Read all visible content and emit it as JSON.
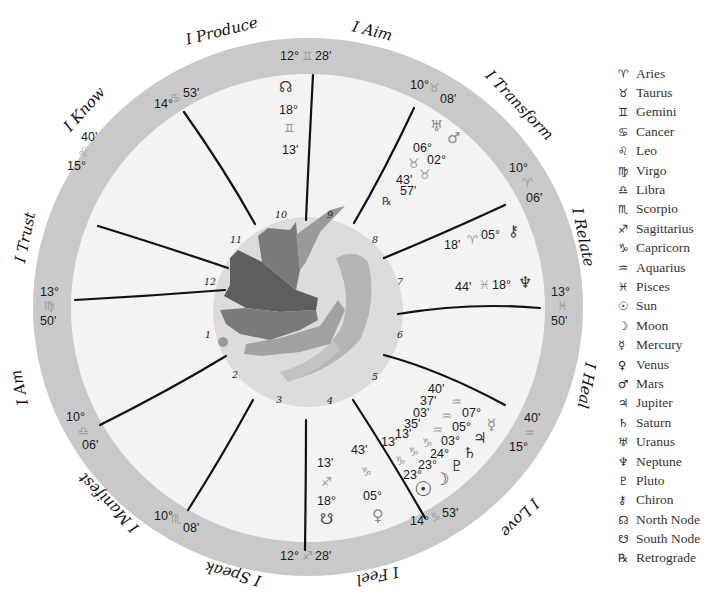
{
  "chart": {
    "themes": [
      {
        "label": "I Produce"
      },
      {
        "label": "I Aim"
      },
      {
        "label": "I Transform"
      },
      {
        "label": "I Relate"
      },
      {
        "label": "I Heal"
      },
      {
        "label": "I Love"
      },
      {
        "label": "I Feel"
      },
      {
        "label": "I Speak"
      },
      {
        "label": "I Manifest"
      },
      {
        "label": "I Am"
      },
      {
        "label": "I Trust"
      },
      {
        "label": "I Know"
      }
    ],
    "cusps": [
      {
        "deg": "12°",
        "sign": "♊",
        "min": "28'"
      },
      {
        "deg": "10°",
        "sign": "♉",
        "min": "08'"
      },
      {
        "deg": "10°",
        "sign": "♈",
        "min": "06'"
      },
      {
        "deg": "13°",
        "sign": "♓",
        "min": "50'"
      },
      {
        "deg": "15°",
        "sign": "♒",
        "min": "40'"
      },
      {
        "deg": "14°",
        "sign": "♑",
        "min": "53'"
      },
      {
        "deg": "12°",
        "sign": "♐",
        "min": "28'"
      },
      {
        "deg": "10°",
        "sign": "♏",
        "min": "08'"
      },
      {
        "deg": "10°",
        "sign": "♎",
        "min": "06'"
      },
      {
        "deg": "13°",
        "sign": "♍",
        "min": "50'"
      },
      {
        "deg": "15°",
        "sign": "♌",
        "min": "40'"
      },
      {
        "deg": "14°",
        "sign": "♋",
        "min": "53'"
      }
    ],
    "house_numbers": [
      "1",
      "2",
      "3",
      "4",
      "5",
      "6",
      "7",
      "8",
      "9",
      "10",
      "11",
      "12"
    ],
    "placements": {
      "north_node": {
        "glyph": "☊",
        "deg": "18°",
        "sign": "♊",
        "min": "13'"
      },
      "uranus": {
        "glyph": "♅",
        "deg": "06°",
        "sign": "♉",
        "min": "43'"
      },
      "mars": {
        "glyph": "♂",
        "deg": "02°",
        "sign": "♉",
        "min": "57'"
      },
      "retrograde_mark": "℞",
      "chiron": {
        "glyph": "⚷",
        "deg": "05°",
        "sign": "♈",
        "min": "18'"
      },
      "neptune": {
        "glyph": "♆",
        "deg": "18°",
        "sign": "♓",
        "min": "44'"
      },
      "mercury": {
        "glyph": "☿",
        "deg": "07°",
        "sign": "♒",
        "min": "40'"
      },
      "jupiter": {
        "glyph": "♃",
        "deg": "05°",
        "sign": "♒",
        "min": "37'"
      },
      "saturn": {
        "glyph": "♄",
        "deg": "03°",
        "sign": "♒",
        "min": "03'"
      },
      "pluto": {
        "glyph": "♇",
        "deg": "24°",
        "sign": "♑",
        "min": "35'"
      },
      "moon": {
        "glyph": "☽",
        "deg": "23°",
        "sign": "♑",
        "min": "13'"
      },
      "sun": {
        "glyph": "☉",
        "deg": "23°",
        "sign": "♑",
        "min": "13'"
      },
      "venus": {
        "glyph": "♀",
        "deg": "05°",
        "sign": "♑",
        "min": "43'"
      },
      "south_node": {
        "glyph": "☋",
        "deg": "18°",
        "sign": "♐",
        "min": "13'"
      }
    }
  },
  "legend": {
    "items": [
      {
        "icon": "♈",
        "label": "Aries"
      },
      {
        "icon": "♉",
        "label": "Taurus"
      },
      {
        "icon": "♊",
        "label": "Gemini"
      },
      {
        "icon": "♋",
        "label": "Cancer"
      },
      {
        "icon": "♌",
        "label": "Leo"
      },
      {
        "icon": "♍",
        "label": "Virgo"
      },
      {
        "icon": "♎",
        "label": "Libra"
      },
      {
        "icon": "♏",
        "label": "Scorpio"
      },
      {
        "icon": "♐",
        "label": "Sagittarius"
      },
      {
        "icon": "♑",
        "label": "Capricorn"
      },
      {
        "icon": "♒",
        "label": "Aquarius"
      },
      {
        "icon": "♓",
        "label": "Pisces"
      },
      {
        "icon": "☉",
        "label": "Sun"
      },
      {
        "icon": "☽",
        "label": "Moon"
      },
      {
        "icon": "☿",
        "label": "Mercury"
      },
      {
        "icon": "♀",
        "label": "Venus"
      },
      {
        "icon": "♂",
        "label": "Mars"
      },
      {
        "icon": "♃",
        "label": "Jupiter"
      },
      {
        "icon": "♄",
        "label": "Saturn"
      },
      {
        "icon": "♅",
        "label": "Uranus"
      },
      {
        "icon": "♆",
        "label": "Neptune"
      },
      {
        "icon": "♇",
        "label": "Pluto"
      },
      {
        "icon": "⚷",
        "label": "Chiron"
      },
      {
        "icon": "☊",
        "label": "North Node"
      },
      {
        "icon": "☋",
        "label": "South Node"
      },
      {
        "icon": "℞",
        "label": "Retrograde"
      }
    ]
  },
  "colors": {
    "ring": "#c9c9c9",
    "inner_disc": "#f3f3f3",
    "center_disc": "#dcdcdc",
    "cusp_line": "#111111",
    "dove_dark": "#5e5e5e",
    "dove_mid": "#7e7e7e",
    "dove_light": "#a8a8a8"
  }
}
